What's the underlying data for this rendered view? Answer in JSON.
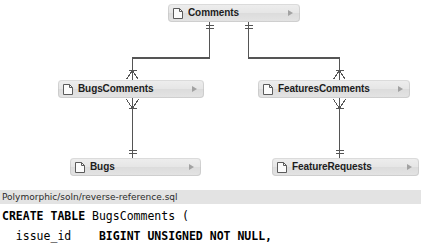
{
  "diagram": {
    "type": "entity-relationship",
    "notation": "crows-foot",
    "entities": [
      {
        "id": "comments",
        "label": "Comments",
        "x": 168,
        "y": 4,
        "width": 132,
        "icon": "document-icon",
        "disclosure": "disclosure-triangle"
      },
      {
        "id": "bugscomments",
        "label": "BugsComments",
        "x": 58,
        "y": 80,
        "width": 146,
        "icon": "document-icon",
        "disclosure": "disclosure-triangle"
      },
      {
        "id": "featurescomments",
        "label": "FeaturesComments",
        "x": 258,
        "y": 80,
        "width": 152,
        "icon": "document-icon",
        "disclosure": "disclosure-triangle"
      },
      {
        "id": "bugs",
        "label": "Bugs",
        "x": 70,
        "y": 158,
        "width": 131,
        "icon": "document-icon",
        "disclosure": "disclosure-triangle"
      },
      {
        "id": "featurerequests",
        "label": "FeatureRequests",
        "x": 272,
        "y": 158,
        "width": 147,
        "icon": "document-icon",
        "disclosure": "disclosure-triangle"
      }
    ],
    "relationships": [
      {
        "from": "comments",
        "to": "bugscomments",
        "from_cardinality": "one",
        "to_cardinality": "many"
      },
      {
        "from": "comments",
        "to": "featurescomments",
        "from_cardinality": "one",
        "to_cardinality": "many"
      },
      {
        "from": "bugscomments",
        "to": "bugs",
        "from_cardinality": "many",
        "to_cardinality": "one"
      },
      {
        "from": "featurescomments",
        "to": "featurerequests",
        "from_cardinality": "many",
        "to_cardinality": "one"
      }
    ],
    "colors": {
      "entity_fill": "#e4e4e4",
      "entity_border": "#bebebe",
      "line": "#555555",
      "label": "#1d1d1d",
      "caption_bar": "#e3e3e3"
    }
  },
  "caption": {
    "text": "Polymorphic/soln/reverse-reference.sql"
  },
  "code": {
    "language": "sql",
    "lines": [
      {
        "parts": [
          {
            "text": "CREATE TABLE",
            "bold": true
          },
          {
            "text": " BugsComments (",
            "bold": false
          }
        ]
      },
      {
        "parts": [
          {
            "text": "  issue_id    ",
            "bold": false
          },
          {
            "text": "BIGINT UNSIGNED NOT NULL,",
            "bold": true
          }
        ]
      }
    ]
  }
}
